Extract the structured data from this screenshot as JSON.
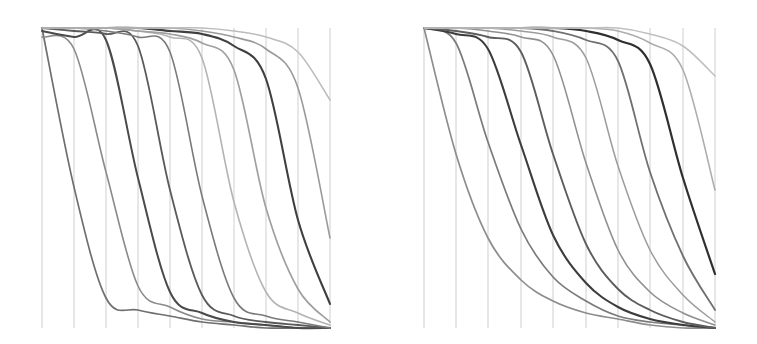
{
  "figure": {
    "title": "",
    "background_color": "#ffffff",
    "width": 757,
    "height": 344,
    "axis_color": "#c9c9c9",
    "axis_width": 0.9
  },
  "chart_data": [
    {
      "type": "line",
      "subtype": "parallel-coordinates",
      "panel": "left",
      "title": "",
      "subtitle": "",
      "xlabel": "",
      "ylabel": "",
      "grid": false,
      "legend_position": "none",
      "annotations": [],
      "axis_count": 10,
      "axis_labels": [
        "",
        "",
        "",
        "",
        "",
        "",
        "",
        "",
        "",
        ""
      ],
      "tick_labels": [],
      "plot_box": {
        "x0": 42,
        "x1": 330,
        "y_top": 28,
        "y_bottom": 328
      },
      "axis_x_positions": [
        42,
        74,
        106,
        138,
        170,
        202,
        234,
        266,
        298,
        330
      ],
      "ylim": [
        0,
        1
      ],
      "categories": [
        "a1",
        "a2",
        "a3",
        "a4",
        "a5",
        "a6",
        "a7",
        "a8",
        "a9",
        "a10"
      ],
      "series": [
        {
          "name": "s1",
          "color": "#6f6f6f",
          "width": 1.7,
          "values": [
            1.0,
            0.47,
            0.1,
            0.06,
            0.04,
            0.02,
            0.01,
            0.0,
            0.0,
            0.0
          ]
        },
        {
          "name": "s2",
          "color": "#8a8a8a",
          "width": 1.6,
          "values": [
            0.97,
            0.93,
            0.52,
            0.14,
            0.07,
            0.03,
            0.02,
            0.01,
            0.0,
            0.0
          ]
        },
        {
          "name": "s3",
          "color": "#4a4a4a",
          "width": 2.0,
          "values": [
            0.99,
            0.97,
            0.96,
            0.5,
            0.12,
            0.05,
            0.02,
            0.01,
            0.0,
            0.0
          ]
        },
        {
          "name": "s4",
          "color": "#5a5a5a",
          "width": 1.8,
          "values": [
            1.0,
            0.99,
            0.98,
            0.94,
            0.46,
            0.11,
            0.04,
            0.02,
            0.01,
            0.0
          ]
        },
        {
          "name": "s5",
          "color": "#7a7a7a",
          "width": 1.6,
          "values": [
            1.0,
            1.0,
            0.99,
            0.97,
            0.92,
            0.44,
            0.1,
            0.04,
            0.02,
            0.0
          ]
        },
        {
          "name": "s6",
          "color": "#b4b4b4",
          "width": 1.6,
          "values": [
            1.0,
            1.0,
            1.0,
            0.99,
            0.97,
            0.9,
            0.42,
            0.12,
            0.05,
            0.01
          ]
        },
        {
          "name": "s7",
          "color": "#a0a0a0",
          "width": 1.7,
          "values": [
            1.0,
            1.0,
            1.0,
            0.99,
            0.98,
            0.95,
            0.86,
            0.4,
            0.13,
            0.02
          ]
        },
        {
          "name": "s8",
          "color": "#3f3f3f",
          "width": 2.1,
          "values": [
            1.0,
            1.0,
            1.0,
            1.0,
            0.99,
            0.98,
            0.94,
            0.83,
            0.36,
            0.08
          ]
        },
        {
          "name": "s9",
          "color": "#9a9a9a",
          "width": 1.6,
          "values": [
            1.0,
            1.0,
            1.0,
            1.0,
            1.0,
            0.99,
            0.97,
            0.93,
            0.8,
            0.3
          ]
        },
        {
          "name": "s10",
          "color": "#bcbcbc",
          "width": 1.6,
          "values": [
            1.0,
            1.0,
            1.0,
            1.0,
            1.0,
            1.0,
            0.99,
            0.97,
            0.92,
            0.76
          ]
        }
      ]
    },
    {
      "type": "line",
      "subtype": "parallel-coordinates",
      "panel": "right",
      "title": "",
      "subtitle": "",
      "xlabel": "",
      "ylabel": "",
      "grid": false,
      "legend_position": "none",
      "annotations": [],
      "axis_count": 10,
      "axis_labels": [
        "",
        "",
        "",
        "",
        "",
        "",
        "",
        "",
        "",
        ""
      ],
      "tick_labels": [],
      "plot_box": {
        "x0": 424,
        "x1": 715,
        "y_top": 28,
        "y_bottom": 328
      },
      "axis_x_positions": [
        424,
        456,
        488,
        521,
        553,
        586,
        618,
        650,
        683,
        715
      ],
      "ylim": [
        0,
        1
      ],
      "categories": [
        "b1",
        "b2",
        "b3",
        "b4",
        "b5",
        "b6",
        "b7",
        "b8",
        "b9",
        "b10"
      ],
      "series": [
        {
          "name": "t1",
          "color": "#8d8d8d",
          "width": 1.7,
          "values": [
            1.0,
            0.58,
            0.3,
            0.16,
            0.09,
            0.05,
            0.03,
            0.01,
            0.0,
            0.0
          ]
        },
        {
          "name": "t2",
          "color": "#7b7b7b",
          "width": 1.7,
          "values": [
            1.0,
            0.95,
            0.62,
            0.33,
            0.17,
            0.09,
            0.04,
            0.02,
            0.01,
            0.0
          ]
        },
        {
          "name": "t3",
          "color": "#3c3c3c",
          "width": 2.1,
          "values": [
            1.0,
            0.98,
            0.93,
            0.61,
            0.31,
            0.15,
            0.07,
            0.03,
            0.01,
            0.0
          ]
        },
        {
          "name": "t4",
          "color": "#5d5d5d",
          "width": 1.9,
          "values": [
            1.0,
            0.99,
            0.97,
            0.92,
            0.58,
            0.28,
            0.13,
            0.06,
            0.02,
            0.0
          ]
        },
        {
          "name": "t5",
          "color": "#909090",
          "width": 1.6,
          "values": [
            1.0,
            1.0,
            0.99,
            0.97,
            0.91,
            0.55,
            0.26,
            0.12,
            0.05,
            0.01
          ]
        },
        {
          "name": "t6",
          "color": "#9c9c9c",
          "width": 1.5,
          "values": [
            1.0,
            1.0,
            1.0,
            0.99,
            0.97,
            0.9,
            0.54,
            0.26,
            0.11,
            0.02
          ]
        },
        {
          "name": "t7",
          "color": "#707070",
          "width": 1.8,
          "values": [
            1.0,
            1.0,
            1.0,
            1.0,
            0.99,
            0.96,
            0.89,
            0.52,
            0.24,
            0.06
          ]
        },
        {
          "name": "t8",
          "color": "#2f2f2f",
          "width": 2.2,
          "values": [
            1.0,
            1.0,
            1.0,
            1.0,
            1.0,
            0.99,
            0.96,
            0.88,
            0.5,
            0.18
          ]
        },
        {
          "name": "t9",
          "color": "#adadad",
          "width": 1.6,
          "values": [
            1.0,
            1.0,
            1.0,
            1.0,
            1.0,
            1.0,
            0.99,
            0.95,
            0.86,
            0.46
          ]
        },
        {
          "name": "t10",
          "color": "#c0c0c0",
          "width": 1.6,
          "values": [
            1.0,
            1.0,
            1.0,
            1.0,
            1.0,
            1.0,
            1.0,
            0.98,
            0.94,
            0.84
          ]
        }
      ]
    }
  ]
}
